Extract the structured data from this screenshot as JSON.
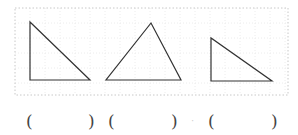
{
  "figure": {
    "border": {
      "x": 15,
      "y": 8,
      "width": 273,
      "height": 87,
      "color": "#c8c8c8",
      "style": "dotted"
    },
    "grid": {
      "spacing": 15,
      "color": "#ececec",
      "style": "dotted"
    },
    "stroke_color": "#333333",
    "triangles": [
      {
        "id": "triangle-1",
        "kind": "right-angled",
        "points": "30,22 30,80 90,80"
      },
      {
        "id": "triangle-2",
        "kind": "acute",
        "points": "151,23 106,80 181,80"
      },
      {
        "id": "triangle-3",
        "kind": "right-angled",
        "points": "211,38 211,81 272,81"
      }
    ]
  },
  "answers": [
    {
      "open": "(",
      "close": ")",
      "value": ""
    },
    {
      "open": "(",
      "close": ")",
      "value": ""
    },
    {
      "open": "(",
      "close": ")",
      "value": ""
    }
  ],
  "separator": "·"
}
